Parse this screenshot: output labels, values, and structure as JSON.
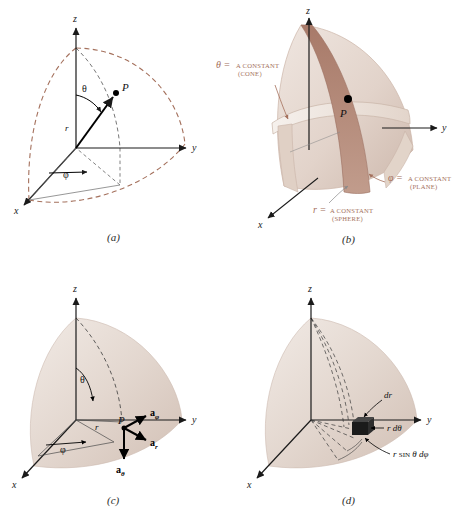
{
  "figure": {
    "colors": {
      "dashed_arc": "#a4705c",
      "annotation_text": "#a4705c",
      "surface_light": "#e9ded6",
      "surface_mid": "#d9c8bd",
      "surface_dark": "#b5897a",
      "axis": "#1a1a1a",
      "background": "#ffffff"
    },
    "panels": [
      {
        "id": "a",
        "caption": "(a)",
        "axes": {
          "x": "x",
          "y": "y",
          "z": "z"
        },
        "point_label": "P",
        "angles": {
          "polar": "θ",
          "azimuth": "φ"
        },
        "radius_label": "r"
      },
      {
        "id": "b",
        "caption": "(b)",
        "axes": {
          "x": "x",
          "y": "y",
          "z": "z"
        },
        "point_label": "P",
        "annotations": [
          {
            "name": "theta-constant",
            "symbol": "θ =",
            "text": "A CONSTANT",
            "sub": "(CONE)"
          },
          {
            "name": "phi-constant",
            "symbol": "φ =",
            "text": "A CONSTANT",
            "sub": "(PLANE)"
          },
          {
            "name": "r-constant",
            "symbol": "r =",
            "text": "A CONSTANT",
            "sub": "(SPHERE)"
          }
        ]
      },
      {
        "id": "c",
        "caption": "(c)",
        "axes": {
          "x": "x",
          "y": "y",
          "z": "z"
        },
        "point_label": "P",
        "angles": {
          "polar": "θ",
          "azimuth": "φ"
        },
        "radius_label": "r",
        "unit_vectors": [
          {
            "name": "a-phi",
            "base": "a",
            "sub": "φ"
          },
          {
            "name": "a-r",
            "base": "a",
            "sub": "r"
          },
          {
            "name": "a-theta",
            "base": "a",
            "sub": "θ"
          }
        ]
      },
      {
        "id": "d",
        "caption": "(d)",
        "axes": {
          "x": "x",
          "y": "y",
          "z": "z"
        },
        "differentials": [
          {
            "name": "dr",
            "text": "dr"
          },
          {
            "name": "r-dtheta",
            "text": "r dθ"
          },
          {
            "name": "r-sin-theta-dphi",
            "pre": "r ",
            "smallcap": "SIN",
            "post": " θ dφ"
          }
        ]
      }
    ]
  }
}
